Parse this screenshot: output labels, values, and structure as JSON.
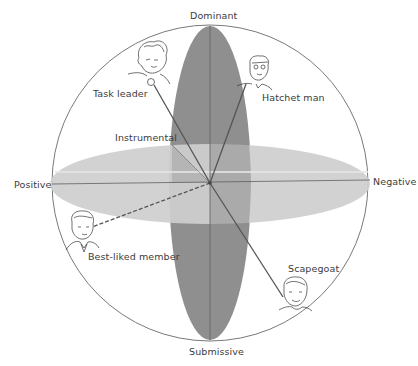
{
  "diagram": {
    "type": "three-dimensional group role space",
    "axes": {
      "top": "Dominant",
      "bottom": "Submissive",
      "left": "Positive",
      "right": "Negative",
      "depth": "Instrumental"
    },
    "roles": [
      {
        "name": "Task leader",
        "direction": "dominant-positive-instrumental"
      },
      {
        "name": "Hatchet man",
        "direction": "dominant-negative"
      },
      {
        "name": "Best-liked member",
        "direction": "positive-submissive"
      },
      {
        "name": "Scapegoat",
        "direction": "negative-submissive"
      }
    ],
    "colors": {
      "vertical_plane": "#8f8f8f",
      "horizontal_plane": "#cfcfcf",
      "overlap": "#a3a3a3",
      "lines": "#555555",
      "circle": "#6a6a6a"
    }
  }
}
